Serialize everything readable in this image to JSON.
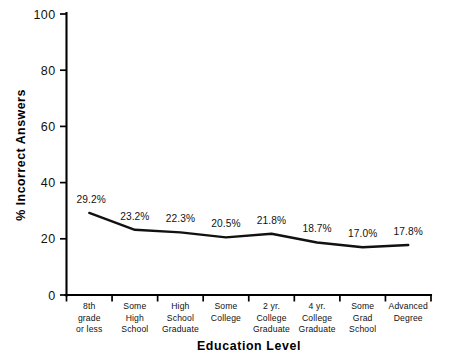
{
  "chart_data": {
    "type": "line",
    "title": "",
    "xlabel": "Education Level",
    "ylabel": "% Incorrect Answers",
    "categories": [
      "8th\ngrade\nor less",
      "Some\nHigh\nSchool",
      "High\nSchool\nGraduate",
      "Some\nCollege",
      "2 yr.\nCollege\nGraduate",
      "4 yr.\nCollege\nGraduate",
      "Some\nGrad\nSchool",
      "Advanced\nDegree"
    ],
    "category_lines": [
      [
        "8th",
        "grade",
        "or less"
      ],
      [
        "Some",
        "High",
        "School"
      ],
      [
        "High",
        "School",
        "Graduate"
      ],
      [
        "Some",
        "College"
      ],
      [
        "2 yr.",
        "College",
        "Graduate"
      ],
      [
        "4 yr.",
        "College",
        "Graduate"
      ],
      [
        "Some",
        "Grad",
        "School"
      ],
      [
        "Advanced",
        "Degree"
      ]
    ],
    "values": [
      29.2,
      23.2,
      22.3,
      20.5,
      21.8,
      18.7,
      17.0,
      17.8
    ],
    "point_labels": [
      "29.2%",
      "23.2%",
      "22.3%",
      "20.5%",
      "21.8%",
      "18.7%",
      "17.0%",
      "17.8%"
    ],
    "ylim": [
      0,
      100
    ],
    "yticks": [
      0,
      20,
      40,
      60,
      80,
      100
    ],
    "ytick_labels": [
      "0",
      "20",
      "40",
      "60",
      "80",
      "100"
    ],
    "grid": false,
    "legend": "none",
    "series_color": "#111111",
    "axis_color": "#000000",
    "background_color": "#ffffff"
  }
}
